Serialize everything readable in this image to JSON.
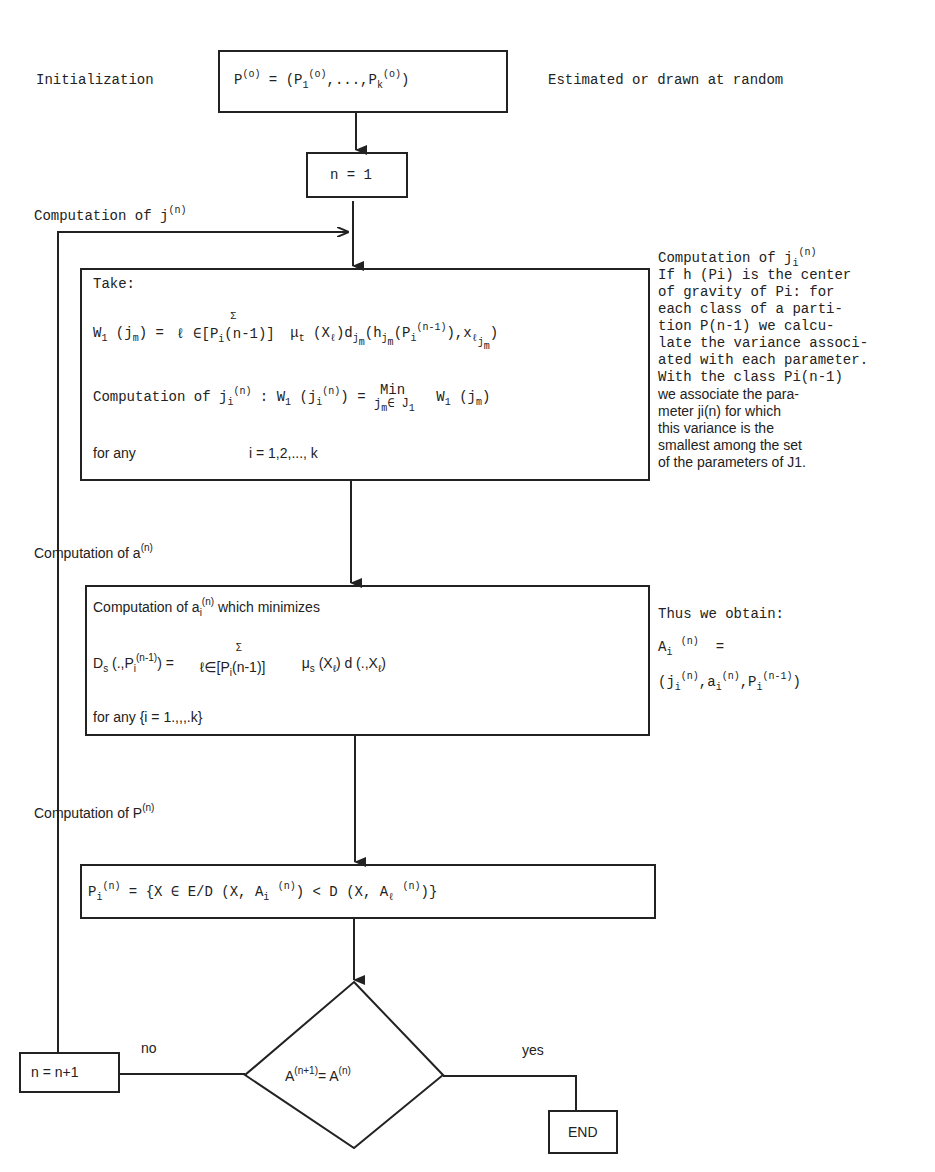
{
  "diagram": {
    "type": "flowchart",
    "init": {
      "label": "Initialization",
      "box_text": "P(o) = (P1(o),...,Pk(o))",
      "note": "Estimated or drawn at random"
    },
    "n_init": {
      "text": "n = 1"
    },
    "loop_label_j": {
      "prefix": "Computation of j",
      "sup": "(n)"
    },
    "box_j": {
      "take": "Take:",
      "w_formula": "W1 (jm) = Σ_{ℓ ∈ [Pi(n-1)]} μt (Xℓ) djm (hjm (Pi(n-1)), xℓjm)",
      "comp_line": "Computation of ji(n) : W1 (ji(n)) = Min_{jm ∈ J1} W1 (jm)",
      "for_any": "for any",
      "range": "i = 1,2,..., k"
    },
    "note_j": {
      "title": "Computation of ji(n)",
      "lines": [
        "If h (Pi) is the center",
        "of gravity of Pi: for",
        "each class of a parti-",
        "tion P(n-1)   we calcu-",
        "late the variance associ-",
        "ated with each parameter.",
        "With the class Pi(n-1)",
        "we associate the para-",
        "meter ji(n) for which",
        "this variance is the",
        "smallest among the set",
        "of the parameters of J1."
      ]
    },
    "loop_label_a": {
      "prefix": "Computation of a",
      "sup": "(n)"
    },
    "box_a": {
      "line1": "Computation of ai(n) which minimizes",
      "d_formula": "Ds (.,Pi(n-1)) = Σ_{ℓ∈[Pi(n-1)]} μs (Xℓ) d (.,Xℓ)",
      "for_any": "for any {i = 1.,,,.k}"
    },
    "note_a": {
      "title": "Thus we obtain:",
      "line2": "Ai(n) =",
      "line3": "(ji(n),ai(n),Pi(n-1))"
    },
    "loop_label_p": {
      "prefix": "Computation of P",
      "sup": "(n)"
    },
    "box_p": {
      "formula": "Pi(n) = {X ∈ E/D (X, Ai(n)) < D (X, Aℓ(n))}"
    },
    "decision": {
      "text": "A(n+1) = A(n)",
      "no": "no",
      "yes": "yes"
    },
    "increment": {
      "text": "n = n+1"
    },
    "end": {
      "text": "END"
    },
    "tokens": {
      "eq": "=",
      "n": "(n)",
      "n1": "(n-1)",
      "o": "(o)",
      "np1": "(n+1)",
      "sigma": "Σ",
      "min": "Min"
    }
  }
}
